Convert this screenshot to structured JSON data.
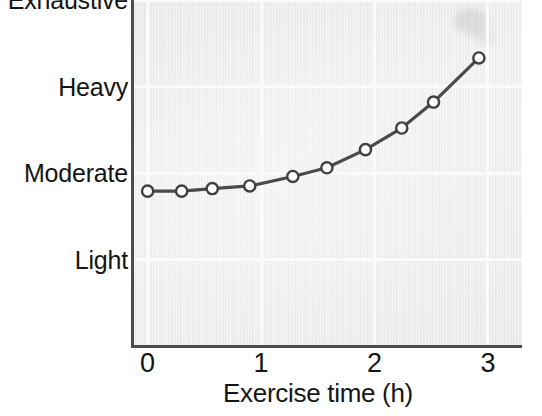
{
  "chart_data": {
    "type": "line",
    "title": "",
    "subtitle": "",
    "xlabel": "Exercise time (h)",
    "ylabel": "",
    "xlim": [
      -0.12,
      3.3
    ],
    "ylim": [
      0,
      4
    ],
    "grid": true,
    "legend": null,
    "x_ticks": [
      "0",
      "1",
      "2",
      "3"
    ],
    "x_tick_values": [
      0,
      1,
      2,
      3
    ],
    "y_ticks": [
      "Light",
      "Moderate",
      "Heavy",
      "Exhaustive"
    ],
    "y_tick_values": [
      1,
      2,
      3,
      4
    ],
    "marker": "open-circle",
    "line_color": "#4a4a4a",
    "marker_fill": "#ffffff",
    "marker_edge": "#3f3f3f",
    "plot_background": "#efefef",
    "gridline_color": "#fbfbfb",
    "axis_color": "#4c4c4c",
    "series": [
      {
        "name": "Perceived exertion",
        "x": [
          0.0,
          0.3,
          0.57,
          0.9,
          1.28,
          1.58,
          1.92,
          2.24,
          2.52,
          2.92
        ],
        "y": [
          1.79,
          1.79,
          1.82,
          1.85,
          1.96,
          2.06,
          2.27,
          2.52,
          2.82,
          3.33
        ],
        "y_labels": [
          "just below Moderate",
          "just below Moderate",
          "just below Moderate",
          "just below Moderate",
          "Moderate",
          "slightly above Moderate",
          "between Moderate and Heavy",
          "approaching Heavy",
          "just above Heavy",
          "Exhaustive"
        ]
      }
    ]
  },
  "axis": {
    "x_title": "Exercise time (h)"
  }
}
